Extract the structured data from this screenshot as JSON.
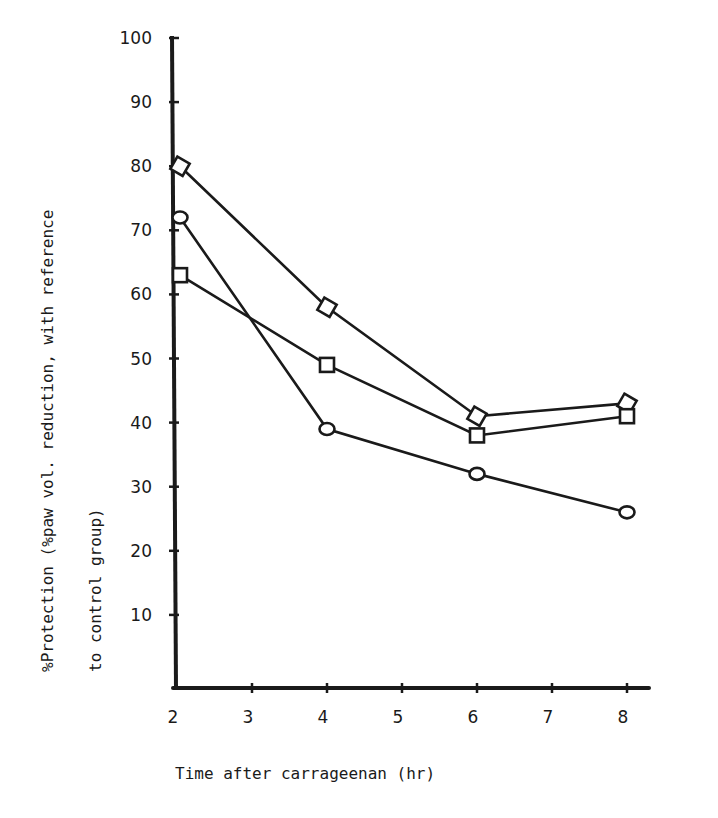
{
  "chart_data": {
    "type": "line",
    "title": "",
    "xlabel": "Time after carrageenan (hr)",
    "ylabel_line1": "%Protection (%paw vol. reduction, with reference",
    "ylabel_line2": "to control group)",
    "x_ticks": [
      2,
      3,
      4,
      5,
      6,
      7,
      8
    ],
    "y_ticks": [
      10,
      20,
      30,
      40,
      50,
      60,
      70,
      80,
      90,
      100
    ],
    "xlim": [
      2,
      8.9
    ],
    "ylim": [
      0,
      100
    ],
    "grid": false,
    "legend": "none",
    "x": [
      2,
      4,
      6,
      8
    ],
    "series": [
      {
        "name": "diamond",
        "marker": "diamond",
        "values": [
          80,
          58,
          41,
          43
        ]
      },
      {
        "name": "square",
        "marker": "square",
        "values": [
          63,
          49,
          38,
          41
        ]
      },
      {
        "name": "circle",
        "marker": "circle",
        "values": [
          72,
          39,
          32,
          26
        ]
      }
    ]
  },
  "colors": {
    "ink": "#1a1a1a",
    "background": "#ffffff"
  }
}
